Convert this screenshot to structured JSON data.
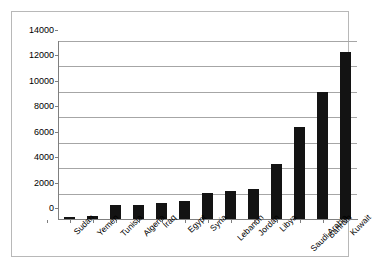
{
  "chart_data": {
    "type": "bar",
    "title": "",
    "subtitle": "",
    "xlabel": "",
    "ylabel": "",
    "categories": [
      "Sudan",
      "Yemen",
      "Tunisia",
      "Algeria",
      "Iraq",
      "Egypt",
      "Syria",
      "Lebanon",
      "Jordan",
      "Libya",
      "Saudi Arabia",
      "Bahrain",
      "Kuwait"
    ],
    "values": [
      150,
      230,
      1100,
      1110,
      1250,
      1380,
      2080,
      2170,
      2370,
      4350,
      7250,
      10000,
      13150
    ],
    "ylim": [
      0,
      14000
    ],
    "yticks": [
      0,
      2000,
      4000,
      6000,
      8000,
      10000,
      12000,
      14000
    ],
    "ytick_labels": [
      "0",
      "2000",
      "4000",
      "6000",
      "8000",
      "10000",
      "12000",
      "14000"
    ],
    "grid": "horizontal",
    "legend": "none",
    "bar_color": "#131313",
    "gridline_color": "#a6a6a6",
    "axis_color": "#7f7f7f",
    "frame_color": "#b8b8b8",
    "background_color": "#ffffff"
  }
}
